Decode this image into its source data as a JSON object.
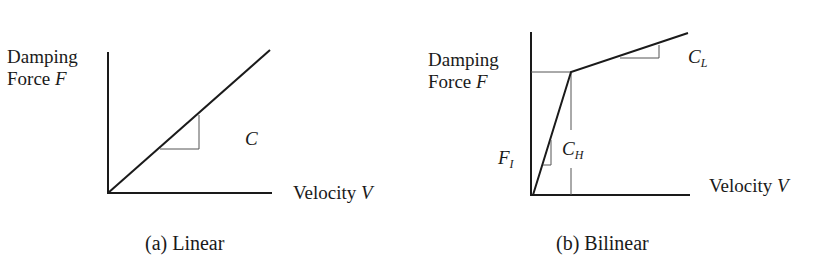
{
  "panels": [
    {
      "id": "a",
      "caption": "(a) Linear",
      "y_label_line1": "Damping",
      "y_label_line2_text": "Force ",
      "y_label_line2_var": "F",
      "x_label_text": "Velocity ",
      "x_label_var": "V",
      "slope_label": "C",
      "model": "linear"
    },
    {
      "id": "b",
      "caption": "(b) Bilinear",
      "y_label_line1": "Damping",
      "y_label_line2_text": "Force ",
      "y_label_line2_var": "F",
      "x_label_text": "Velocity ",
      "x_label_var": "V",
      "high_slope_label_main": "C",
      "high_slope_label_sub": "H",
      "low_slope_label_main": "C",
      "low_slope_label_sub": "L",
      "yield_force_label_main": "F",
      "yield_force_label_sub": "I",
      "model": "bilinear"
    }
  ],
  "colors": {
    "line": "#1a1a1a",
    "guide": "#555555",
    "background": "#ffffff"
  }
}
